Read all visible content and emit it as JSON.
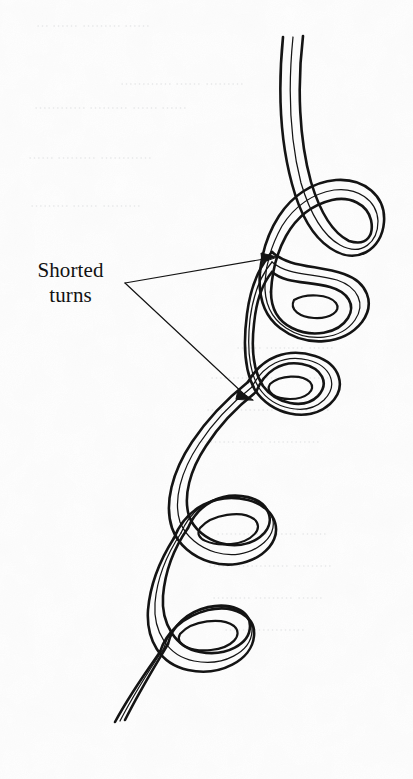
{
  "figure": {
    "kind": "technical-line-drawing",
    "background_color": "#fdfdfd",
    "ink_color": "#141414",
    "callout": {
      "line1": "Shorted",
      "line2": "turns",
      "full_text": "Shorted turns",
      "leader_vertex": {
        "x": 125,
        "y": 283
      },
      "arrow_targets": [
        {
          "x": 272,
          "y": 257,
          "name": "upper-shorted-turn"
        },
        {
          "x": 248,
          "y": 396,
          "name": "lower-shorted-turn"
        }
      ]
    },
    "coil": {
      "turn_count": 4,
      "tube_style": "double-outline",
      "lead_top": {
        "x": 283,
        "y": 36
      },
      "lead_bottom": {
        "x": 106,
        "y": 722
      },
      "shorted_turn_indices": [
        1,
        2
      ]
    }
  }
}
